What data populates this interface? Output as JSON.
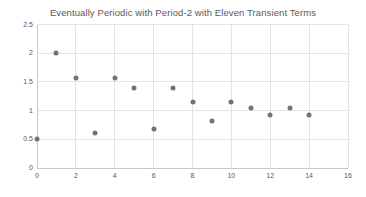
{
  "chart": {
    "title": "Eventually Periodic with Period-2 with Eleven Transient Terms"
  },
  "chart_data": {
    "type": "scatter",
    "title": "Eventually Periodic with Period-2 with Eleven Transient Terms",
    "x": [
      0,
      1,
      2,
      3,
      4,
      5,
      6,
      7,
      8,
      9,
      10,
      11,
      12,
      13,
      14
    ],
    "y": [
      0.5,
      2.0,
      1.57,
      0.61,
      1.57,
      1.4,
      0.68,
      1.4,
      1.15,
      0.82,
      1.15,
      1.05,
      0.93,
      1.05,
      0.93
    ],
    "xlabel": "",
    "ylabel": "",
    "xlim": [
      0,
      16
    ],
    "ylim": [
      0,
      2.5
    ],
    "xticks": [
      0,
      2,
      4,
      6,
      8,
      10,
      12,
      14,
      16
    ],
    "yticks": [
      0,
      0.5,
      1,
      1.5,
      2,
      2.5
    ],
    "grid": "on",
    "legend": "none",
    "colors": {
      "marker": "#737373",
      "gridline": "#e4e4e4",
      "axis_line": "#c9c9c9",
      "tick_text": "#595959",
      "title_text": "#595959"
    }
  }
}
